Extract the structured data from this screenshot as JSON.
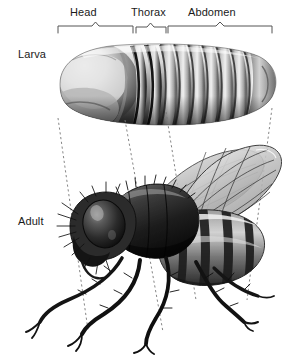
{
  "figure": {
    "background_color": "#ffffff",
    "width": 293,
    "height": 358,
    "text_color": "#1a1a1a",
    "line_color": "#555555"
  },
  "region_labels": [
    {
      "id": "head",
      "label": "Head",
      "bracket_start_x": 58,
      "bracket_end_x": 133
    },
    {
      "id": "thorax",
      "label": "Thorax",
      "bracket_start_x": 136,
      "bracket_end_x": 166
    },
    {
      "id": "abdomen",
      "label": "Abdomen",
      "bracket_start_x": 168,
      "bracket_end_x": 272
    }
  ],
  "stage_labels": [
    {
      "id": "larva",
      "label": "Larva"
    },
    {
      "id": "adult",
      "label": "Adult"
    }
  ],
  "connector_lines": [
    {
      "id": "connector-head-front",
      "x1": 58,
      "y1": 118,
      "x2": 88,
      "y2": 330
    },
    {
      "id": "connector-head-thorax",
      "x1": 125,
      "y1": 118,
      "x2": 163,
      "y2": 330
    },
    {
      "id": "connector-thorax-abdomen",
      "x1": 165,
      "y1": 112,
      "x2": 195,
      "y2": 300
    },
    {
      "id": "connector-abdomen-end",
      "x1": 272,
      "y1": 112,
      "x2": 248,
      "y2": 300
    }
  ]
}
